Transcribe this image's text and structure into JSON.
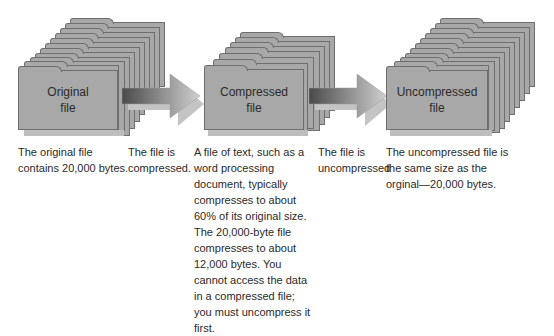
{
  "stages": [
    {
      "id": "original",
      "label_line1": "Original",
      "label_line2": "file",
      "caption": "The original file contains 20,000 bytes."
    },
    {
      "id": "compressed",
      "label_line1": "Compressed",
      "label_line2": "file",
      "caption": "A file of text, such as a word processing document, typically compresses to about 60% of its original size. The 20,000-byte file compresses to about 12,000 bytes. You cannot access the data in a compressed file; you must uncompress it first."
    },
    {
      "id": "uncompressed",
      "label_line1": "Uncompressed",
      "label_line2": "file",
      "caption": "The uncompressed file is the same size as the orginal—20,000 bytes."
    }
  ],
  "arrows": [
    {
      "id": "compress-arrow",
      "caption": "The file is compressed."
    },
    {
      "id": "uncompress-arrow",
      "caption": "The file is uncompressed"
    }
  ],
  "colors": {
    "card_fill": "#a8a8a8",
    "card_border": "#6e6e6e",
    "arrow_dark": "#4a4a4a",
    "arrow_light": "#cfcfcf"
  }
}
